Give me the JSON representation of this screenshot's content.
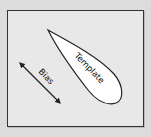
{
  "diagram": {
    "labels": {
      "template": "Template",
      "bias": "Bias"
    },
    "colors": {
      "background": "#dcdcdc",
      "frame_fill": "#e8e8e8",
      "shape_fill": "#ffffff",
      "stroke": "#222222"
    }
  }
}
